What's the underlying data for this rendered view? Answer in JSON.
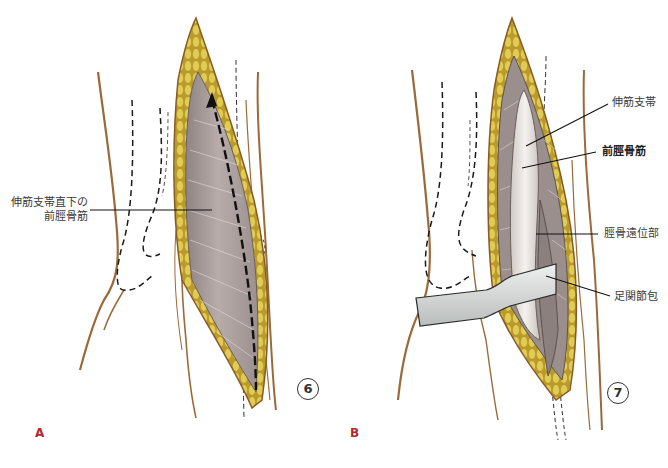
{
  "figure": {
    "type": "surgical-anatomical-illustration",
    "panels": [
      {
        "id": "A",
        "letter": "A",
        "figure_number": "6",
        "labels": [
          {
            "line1": "伸筋支帯直下の",
            "line2": "前脛骨筋"
          }
        ]
      },
      {
        "id": "B",
        "letter": "B",
        "figure_number": "7",
        "labels": [
          {
            "text": "伸筋支帯",
            "bold": false
          },
          {
            "text": "前脛骨筋",
            "bold": true
          },
          {
            "text": "脛骨遠位部",
            "bold": false
          },
          {
            "text": "足関節包",
            "bold": false
          }
        ]
      }
    ],
    "colors": {
      "skin_outline": "#9a6a3a",
      "fat_yellow": "#d9c24a",
      "muscle_gray": "#a79a98",
      "tendon_white": "#e8e4e0",
      "retractor": "#d7dad8",
      "panel_letter": "#b3262e",
      "label_text": "#3a3a3a",
      "leader_line": "#111111"
    }
  }
}
